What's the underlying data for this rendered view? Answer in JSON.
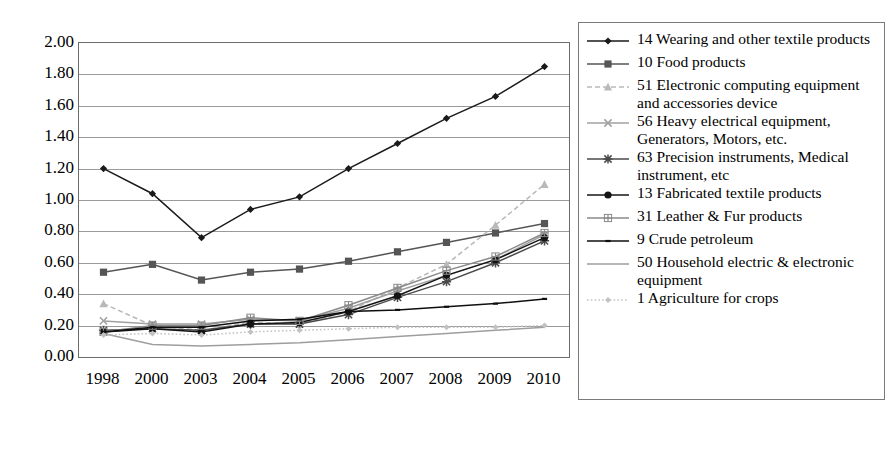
{
  "chart_data": {
    "type": "line",
    "title": "",
    "xlabel": "",
    "ylabel": "",
    "categories": [
      "1998",
      "2000",
      "2003",
      "2004",
      "2005",
      "2006",
      "2007",
      "2008",
      "2009",
      "2010"
    ],
    "ylim": [
      0.0,
      2.0
    ],
    "ytick_step": 0.2,
    "ytick_labels": [
      "2.00",
      "1.80",
      "1.60",
      "1.40",
      "1.20",
      "1.00",
      "0.80",
      "0.60",
      "0.40",
      "0.20",
      "0.00"
    ],
    "grid": true,
    "legend_position": "right",
    "series": [
      {
        "name": "14 Wearing and other textile products",
        "marker": "diamond",
        "color": "#1a1a1a",
        "dash": "solid",
        "values": [
          1.2,
          1.04,
          0.76,
          0.94,
          1.02,
          1.2,
          1.36,
          1.52,
          1.66,
          1.85
        ]
      },
      {
        "name": "10 Food products",
        "marker": "square",
        "color": "#555555",
        "dash": "solid",
        "values": [
          0.54,
          0.59,
          0.49,
          0.54,
          0.56,
          0.61,
          0.67,
          0.73,
          0.79,
          0.85
        ]
      },
      {
        "name": "51 Electronic computing equipment and accessories device",
        "marker": "triangle",
        "color": "#b9b9b9",
        "dash": "dashed",
        "values": [
          0.34,
          0.2,
          0.17,
          0.22,
          0.21,
          0.29,
          0.44,
          0.59,
          0.84,
          1.1
        ]
      },
      {
        "name": "56 Heavy electrical equipment, Generators, Motors, etc.",
        "marker": "cross",
        "color": "#a0a0a0",
        "dash": "solid",
        "values": [
          0.23,
          0.21,
          0.21,
          0.24,
          0.23,
          0.31,
          0.42,
          0.52,
          0.62,
          0.78
        ]
      },
      {
        "name": "63 Precision instruments, Medical instrument, etc",
        "marker": "star",
        "color": "#4a4a4a",
        "dash": "solid",
        "values": [
          0.17,
          0.18,
          0.17,
          0.21,
          0.21,
          0.27,
          0.38,
          0.48,
          0.6,
          0.74
        ]
      },
      {
        "name": "13 Fabricated textile products",
        "marker": "circle",
        "color": "#141414",
        "dash": "solid",
        "values": [
          0.16,
          0.18,
          0.16,
          0.21,
          0.22,
          0.29,
          0.39,
          0.52,
          0.62,
          0.76
        ]
      },
      {
        "name": "31 Leather & Fur products",
        "marker": "plus-square",
        "color": "#8a8a8a",
        "dash": "solid",
        "values": [
          0.16,
          0.2,
          0.2,
          0.25,
          0.23,
          0.33,
          0.44,
          0.55,
          0.64,
          0.79
        ]
      },
      {
        "name": "9 Crude petroleum",
        "marker": "dash",
        "color": "#0f0f0f",
        "dash": "solid",
        "values": [
          0.16,
          0.19,
          0.19,
          0.23,
          0.24,
          0.29,
          0.3,
          0.32,
          0.34,
          0.37
        ]
      },
      {
        "name": "50 Household electric & electronic equipment",
        "marker": "none",
        "color": "#9e9e9e",
        "dash": "solid",
        "values": [
          0.15,
          0.08,
          0.07,
          0.08,
          0.09,
          0.11,
          0.13,
          0.15,
          0.17,
          0.19
        ]
      },
      {
        "name": "1 Agriculture for crops",
        "marker": "small-diamond",
        "color": "#c2c2c2",
        "dash": "dotted",
        "values": [
          0.14,
          0.15,
          0.14,
          0.16,
          0.17,
          0.18,
          0.19,
          0.19,
          0.19,
          0.2
        ]
      }
    ]
  },
  "legend": {
    "items": [
      {
        "label": "14 Wearing and other textile products"
      },
      {
        "label": "10 Food products"
      },
      {
        "label": "51 Electronic computing equipment and accessories device"
      },
      {
        "label": "56 Heavy electrical equipment, Generators, Motors, etc."
      },
      {
        "label": "63 Precision instruments, Medical instrument, etc"
      },
      {
        "label": "13 Fabricated textile products"
      },
      {
        "label": "31 Leather & Fur products"
      },
      {
        "label": "9 Crude petroleum"
      },
      {
        "label": "50 Household electric & electronic equipment"
      },
      {
        "label": "1 Agriculture for crops"
      }
    ]
  }
}
